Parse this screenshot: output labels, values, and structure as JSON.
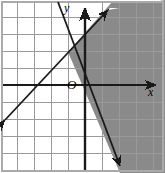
{
  "figure": {
    "kind": "coordinate-plane-graph",
    "width": 165,
    "height": 173,
    "background": "#ffffff",
    "grid_color": "#9a9a9a",
    "axis_color": "#1a1a1a",
    "line_color": "#1a1a1a",
    "shade_color": "#8a8a8a",
    "border_color": "#aaaaaa"
  },
  "labels": {
    "y_axis": "y",
    "x_axis": "x",
    "origin": "O"
  },
  "chart_data": {
    "type": "line",
    "title": "",
    "xlabel": "x",
    "ylabel": "y",
    "grid": true,
    "legend": "none",
    "xlim": [
      -4,
      5
    ],
    "ylim": [
      -5,
      5
    ],
    "grid_spacing": 1,
    "origin_px": [
      85,
      85
    ],
    "unit_px": 17,
    "series": [
      {
        "name": "ascending-boundary-line",
        "type": "line",
        "style": "solid",
        "slope": 1,
        "intercept": 1,
        "arrows": "both",
        "x": [
          -4.5,
          1.5
        ],
        "y": [
          -3.5,
          2.5
        ],
        "px_start": [
          5,
          120
        ],
        "px_end": [
          108,
          10
        ]
      },
      {
        "name": "descending-boundary-line",
        "type": "line",
        "style": "solid",
        "slope": -2.2,
        "intercept": 5.4,
        "arrows": "both",
        "x": [
          -1.2,
          2.0
        ],
        "y": [
          8.0,
          1.0
        ],
        "px_start": [
          58,
          2
        ],
        "px_end": [
          120,
          166
        ]
      }
    ],
    "shaded_region": {
      "fill": "#8a8a8a",
      "description": "region to the right of the descending line and above-right of the ascending line",
      "vertex_px": [
        68,
        52
      ],
      "polygon_px": [
        [
          68,
          52
        ],
        [
          108,
          10
        ],
        [
          165,
          10
        ],
        [
          165,
          173
        ],
        [
          120,
          173
        ]
      ]
    },
    "annotations": [
      {
        "text": "y",
        "px": [
          68,
          8
        ]
      },
      {
        "text": "x",
        "px": [
          152,
          92
        ]
      },
      {
        "text": "O",
        "px": [
          72,
          85
        ]
      }
    ]
  }
}
